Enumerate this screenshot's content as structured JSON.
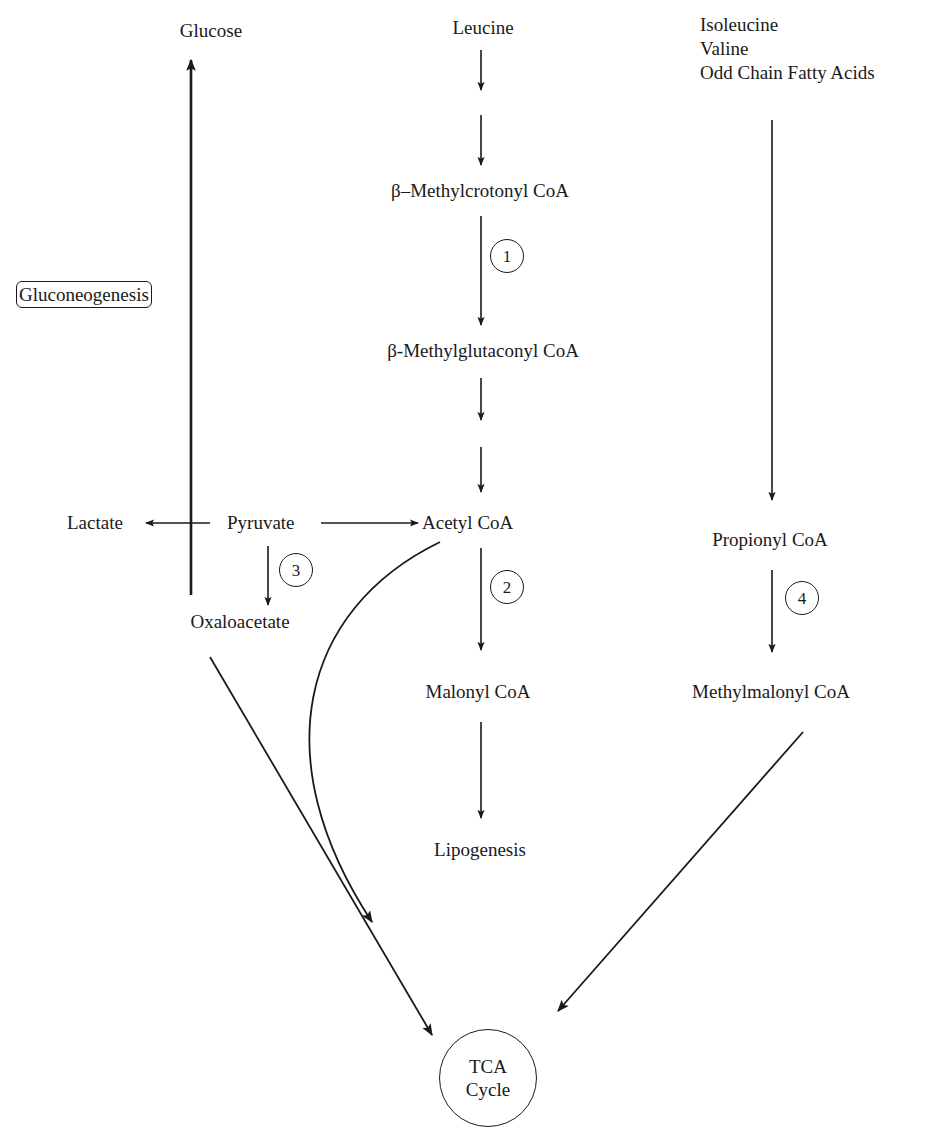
{
  "nodes": {
    "glucose": "Glucose",
    "leucine": "Leucine",
    "beta_methylcrotonyl_coa": "β–Methylcrotonyl CoA",
    "beta_methylglutaconyl_coa": "β-Methylglutaconyl CoA",
    "gluconeogenesis": "Gluconeogenesis",
    "lactate": "Lactate",
    "pyruvate": "Pyruvate",
    "acetyl_coa": "Acetyl CoA",
    "oxaloacetate": "Oxaloacetate",
    "malonyl_coa": "Malonyl CoA",
    "lipogenesis": "Lipogenesis",
    "propionyl_coa": "Propionyl CoA",
    "methylmalonyl_coa": "Methylmalonyl CoA",
    "tca_line1": "TCA",
    "tca_line2": "Cycle"
  },
  "precursors": [
    "Isoleucine",
    "Valine",
    "Odd Chain Fatty Acids"
  ],
  "enzyme_steps": {
    "step1": "1",
    "step2": "2",
    "step3": "3",
    "step4": "4"
  },
  "edges": [
    {
      "from": "Leucine",
      "to": "β–Methylcrotonyl CoA",
      "note": "two-step"
    },
    {
      "from": "β–Methylcrotonyl CoA",
      "to": "β-Methylglutaconyl CoA",
      "step": "1"
    },
    {
      "from": "β-Methylglutaconyl CoA",
      "to": "Acetyl CoA",
      "note": "two-step"
    },
    {
      "from": "Pyruvate",
      "to": "Acetyl CoA"
    },
    {
      "from": "Pyruvate",
      "to": "Lactate"
    },
    {
      "from": "Pyruvate",
      "to": "Oxaloacetate",
      "step": "3"
    },
    {
      "from": "Oxaloacetate",
      "to": "Glucose",
      "via": "Gluconeogenesis"
    },
    {
      "from": "Acetyl CoA",
      "to": "Malonyl CoA",
      "step": "2"
    },
    {
      "from": "Malonyl CoA",
      "to": "Lipogenesis"
    },
    {
      "from": "Isoleucine / Valine / Odd Chain Fatty Acids",
      "to": "Propionyl CoA"
    },
    {
      "from": "Propionyl CoA",
      "to": "Methylmalonyl CoA",
      "step": "4"
    },
    {
      "from": "Oxaloacetate",
      "to": "TCA Cycle"
    },
    {
      "from": "Acetyl CoA",
      "to": "TCA Cycle"
    },
    {
      "from": "Methylmalonyl CoA",
      "to": "TCA Cycle"
    }
  ],
  "colors": {
    "ink": "#1a1a1a",
    "background": "#ffffff"
  }
}
